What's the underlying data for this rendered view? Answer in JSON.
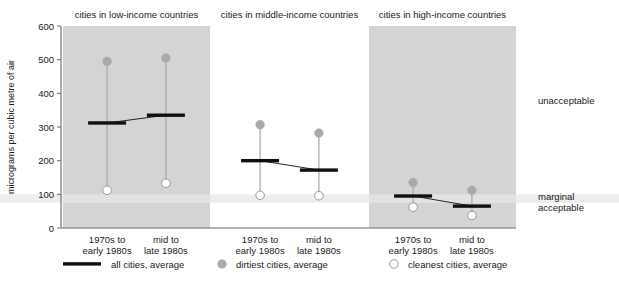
{
  "chart_data": {
    "type": "scatter",
    "title": "",
    "ylabel": "micrograms per cubic metre of air",
    "xlabel": "",
    "ylim": [
      0,
      600
    ],
    "yticks": [
      0,
      100,
      200,
      300,
      400,
      500,
      600
    ],
    "ytick_labels": [
      "0",
      "100",
      "200",
      "300",
      "400",
      "500",
      "600"
    ],
    "grid": false,
    "legend_position": "bottom",
    "categories": [
      "1970s to early 1980s",
      "mid to late 1980s"
    ],
    "category_lines": [
      [
        "1970s to",
        "early 1980s"
      ],
      [
        "mid to",
        "late 1980s"
      ]
    ],
    "panels": [
      {
        "title": "cities in low-income countries",
        "shaded": true,
        "points": [
          {
            "category": "1970s to early 1980s",
            "all_cities_average": 312,
            "dirtiest_cities_average": 495,
            "cleanest_cities_average": 112
          },
          {
            "category": "mid to late 1980s",
            "all_cities_average": 335,
            "dirtiest_cities_average": 505,
            "cleanest_cities_average": 133
          }
        ]
      },
      {
        "title": "cities in middle-income countries",
        "shaded": false,
        "points": [
          {
            "category": "1970s to early 1980s",
            "all_cities_average": 200,
            "dirtiest_cities_average": 307,
            "cleanest_cities_average": 97
          },
          {
            "category": "mid to late 1980s",
            "all_cities_average": 172,
            "dirtiest_cities_average": 282,
            "cleanest_cities_average": 96
          }
        ]
      },
      {
        "title": "cities in high-income countries",
        "shaded": true,
        "points": [
          {
            "category": "1970s to early 1980s",
            "all_cities_average": 95,
            "dirtiest_cities_average": 135,
            "cleanest_cities_average": 62
          },
          {
            "category": "mid to late 1980s",
            "all_cities_average": 65,
            "dirtiest_cities_average": 112,
            "cleanest_cities_average": 37
          }
        ]
      }
    ],
    "bands": [
      {
        "label": "unacceptable",
        "from": 100,
        "to": 600,
        "label_at": 380
      },
      {
        "label": "marginal",
        "from": 75,
        "to": 100,
        "label_at": 95
      },
      {
        "label": "acceptable",
        "from": 0,
        "to": 75,
        "label_at": 62
      }
    ],
    "legend": [
      {
        "key": "line-swatch",
        "label": "all cities, average"
      },
      {
        "key": "filled-circle-swatch",
        "label": "dirtiest cities, average"
      },
      {
        "key": "open-circle-swatch",
        "label": "cleanest cities, average"
      }
    ],
    "colors": {
      "panel_fill": "#d4d4d4",
      "band_fill": "#ededed",
      "dirtiest": "#aaaaaa",
      "cleanest": "#ffffff",
      "all_cities": "#101010",
      "stem": "#a8a8a8",
      "text": "#1a1a1a",
      "background": "#ffffff"
    }
  }
}
